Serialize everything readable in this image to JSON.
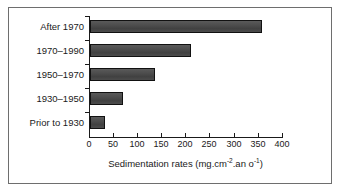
{
  "chart_data": {
    "type": "bar",
    "orientation": "horizontal",
    "title": "",
    "xlabel_parts": {
      "lead": "Sedimentation rates (mg.cm",
      "sup1": "-2",
      "mid": ".an  o",
      "sup2": "-1",
      "tail": ")"
    },
    "xlabel": "Sedimentation rates (mg.cm-2.an o-1)",
    "ylabel": "",
    "categories": [
      "Prior to 1930",
      "1930–1950",
      "1950–1970",
      "1970–1990",
      "After 1970"
    ],
    "values": [
      31,
      69,
      135,
      211,
      359
    ],
    "xlim": [
      0,
      400
    ],
    "xticks": [
      "0",
      "50",
      "100",
      "150",
      "200",
      "250",
      "300",
      "350",
      "400"
    ],
    "xtick_values": [
      0,
      50,
      100,
      150,
      200,
      250,
      300,
      350,
      400
    ],
    "grid": false,
    "legend": "none",
    "bar_color": "#4a4a4a",
    "bar_edge_color": "#111111",
    "axis_color": "#1a1a1a",
    "frame_color": "#6e6e6e",
    "background_color": "#ffffff"
  }
}
